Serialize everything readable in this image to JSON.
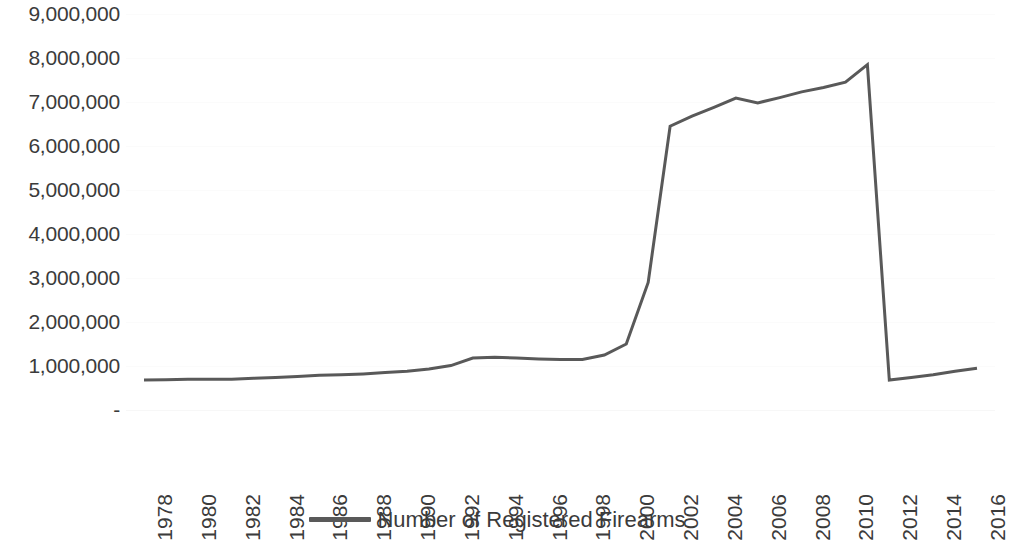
{
  "chart_data": {
    "type": "line",
    "title": "",
    "subtitle": "",
    "xlabel": "",
    "ylabel": "",
    "grid": true,
    "legend_position": "bottom-center",
    "line_color": "#595959",
    "line_width_px": 3,
    "xlim": [
      1978,
      2016
    ],
    "ylim": [
      0,
      9000000
    ],
    "y_tick_labels": [
      "9,000,000",
      "8,000,000",
      "7,000,000",
      "6,000,000",
      "5,000,000",
      "4,000,000",
      "3,000,000",
      "2,000,000",
      "1,000,000",
      "-"
    ],
    "y_tick_values": [
      9000000,
      8000000,
      7000000,
      6000000,
      5000000,
      4000000,
      3000000,
      2000000,
      1000000,
      0
    ],
    "x_tick_labels": [
      "1978",
      "1980",
      "1982",
      "1984",
      "1986",
      "1988",
      "1990",
      "1992",
      "1994",
      "1996",
      "1998",
      "2000",
      "2002",
      "2004",
      "2006",
      "2008",
      "2010",
      "2012",
      "2014",
      "2016"
    ],
    "x_tick_values": [
      1978,
      1980,
      1982,
      1984,
      1986,
      1988,
      1990,
      1992,
      1994,
      1996,
      1998,
      2000,
      2002,
      2004,
      2006,
      2008,
      2010,
      2012,
      2014,
      2016
    ],
    "x": [
      1978,
      1979,
      1980,
      1981,
      1982,
      1983,
      1984,
      1985,
      1986,
      1987,
      1988,
      1989,
      1990,
      1991,
      1992,
      1993,
      1994,
      1995,
      1996,
      1997,
      1998,
      1999,
      2000,
      2001,
      2002,
      2003,
      2004,
      2005,
      2006,
      2007,
      2008,
      2009,
      2010,
      2011,
      2012,
      2013,
      2014,
      2015,
      2016
    ],
    "series": [
      {
        "name": "Number of Registered Firearms",
        "color": "#595959",
        "values": [
          680000,
          690000,
          700000,
          700000,
          700000,
          720000,
          740000,
          760000,
          790000,
          800000,
          820000,
          850000,
          880000,
          930000,
          1010000,
          1180000,
          1200000,
          1180000,
          1160000,
          1150000,
          1150000,
          1250000,
          1500000,
          2900000,
          6450000,
          6680000,
          6880000,
          7090000,
          6980000,
          7100000,
          7230000,
          7330000,
          7450000,
          7850000,
          680000,
          740000,
          800000,
          880000,
          950000
        ]
      }
    ],
    "annotations": []
  },
  "legend": {
    "entries": [
      {
        "label": "Number of Registered Firearms",
        "color": "#595959",
        "marker": "line-swatch"
      }
    ]
  }
}
